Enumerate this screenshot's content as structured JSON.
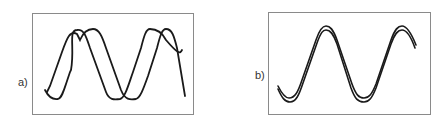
{
  "figure": {
    "panels": [
      {
        "id": "a",
        "label": "a)",
        "description": "Two sinusoidal waves with equal amplitude and period, phase-shifted relative to each other",
        "curves": 2,
        "phase_shift": "approx. quarter period"
      },
      {
        "id": "b",
        "label": "b)",
        "description": "Two nearly coincident sinusoidal waves (in phase, slight offset)",
        "curves": 2,
        "phase_shift": "approx. zero"
      }
    ],
    "colors": {
      "frame": "#8a8a8a",
      "curve": "#1a1a1a",
      "label": "#333333",
      "background": "#ffffff"
    }
  }
}
